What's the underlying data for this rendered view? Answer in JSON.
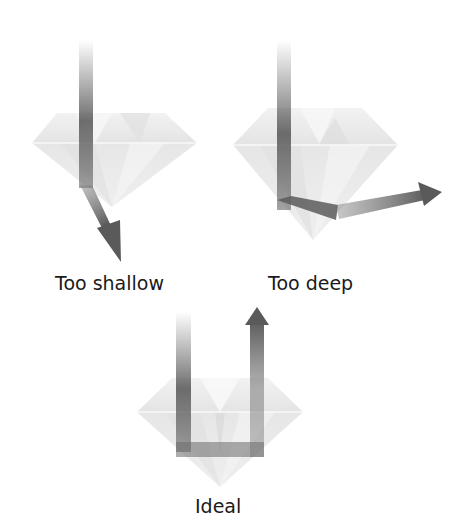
{
  "figure": {
    "colors": {
      "background": "#ffffff",
      "diamond_fill": "#e6e6e6",
      "diamond_facet_light": "#f3f3f3",
      "diamond_facet_dark": "#d6d6d6",
      "beam": "#555555",
      "label_text": "#1a1a1a"
    },
    "diamonds": [
      {
        "id": "too-shallow",
        "label": "Too shallow",
        "light_path": "enters top, passes through pavilion and exits out the bottom"
      },
      {
        "id": "too-deep",
        "label": "Too deep",
        "light_path": "enters top, reflects once off pavilion and exits out the side"
      },
      {
        "id": "ideal",
        "label": "Ideal",
        "light_path": "enters top, reflects twice off pavilion and returns out the top"
      }
    ]
  }
}
